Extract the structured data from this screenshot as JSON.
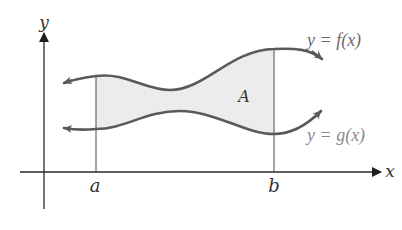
{
  "figure": {
    "colors": {
      "background": "#ffffff",
      "axis": "#2a2a2a",
      "curve": "#5a5a5a",
      "region_fill": "#ececec",
      "bound_line": "#6a6a6a",
      "label_dark": "#333333",
      "label_f": "#6a6a6a",
      "label_g": "#8a8a8a"
    },
    "axes": {
      "x_label": "x",
      "y_label": "y"
    },
    "bounds": {
      "left_label": "a",
      "right_label": "b"
    },
    "region": {
      "label": "A"
    },
    "curves": [
      {
        "id": "f",
        "equation_label": "y = f(x)",
        "role": "upper curve"
      },
      {
        "id": "g",
        "equation_label": "y = g(x)",
        "role": "lower curve"
      }
    ]
  }
}
